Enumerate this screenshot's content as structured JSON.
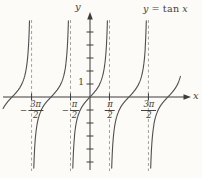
{
  "figure": {
    "y_axis_label": "y",
    "x_axis_label": "x",
    "y_unit_label": "1"
  },
  "chart_data": {
    "type": "line",
    "function": "tan",
    "equation": {
      "lhs": "y",
      "relation": "=",
      "func": "tan",
      "arg": "x"
    },
    "xlabel": "x",
    "ylabel": "y",
    "x_range_radians": [
      -7.0,
      7.3
    ],
    "y_range_units": [
      -5.9,
      5.9
    ],
    "grid": false,
    "legend": "none",
    "origin_px": {
      "x": 90,
      "y": 97
    },
    "scale_px": {
      "per_radian_x": 12.4,
      "per_unit_y": 13
    },
    "branch_centers_radians": [
      -6.2832,
      -3.1416,
      0,
      3.1416,
      6.2832
    ],
    "asymptotes_radians": [
      -4.7124,
      -1.5708,
      1.5708,
      4.7124
    ],
    "x_ticks": [
      {
        "value_radians": -4.7124,
        "sign": "−",
        "numerator": "3π",
        "denominator": "2"
      },
      {
        "value_radians": -1.5708,
        "sign": "−",
        "numerator": "π",
        "denominator": "2"
      },
      {
        "value_radians": 1.5708,
        "sign": "",
        "numerator": "π",
        "denominator": "2"
      },
      {
        "value_radians": 4.7124,
        "sign": "",
        "numerator": "3π",
        "denominator": "2"
      }
    ],
    "y_ticks_units": [
      -5,
      -4,
      -3,
      -2,
      -1,
      1,
      2,
      3,
      4,
      5
    ],
    "y_tick_labels": [
      {
        "value": 1,
        "label": "1"
      }
    ],
    "clip_px": {
      "x_min": 3,
      "x_max": 180.5,
      "y_min": 20,
      "y_max": 171
    },
    "axis_px": {
      "x_start": 3,
      "x_end": 184,
      "x_arrow_tip": 191,
      "y_start": 170,
      "y_end": 19,
      "y_arrow_tip": 12
    },
    "colors": {
      "curve": "#4f4f4f",
      "axis": "#3c3c3c",
      "asymptote": "#a3a19c",
      "text": "#45413a",
      "background": "#fcfbf7"
    }
  }
}
